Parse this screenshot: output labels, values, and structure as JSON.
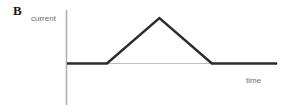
{
  "figure": {
    "panel_label": "B",
    "background_color": "#ffffff"
  },
  "axes": {
    "y_label": "current",
    "x_label": "time",
    "label_color": "#6e6e6e",
    "axis_color": "#b0b0b0",
    "y_axis": {
      "x": 66.5,
      "y_top": 10,
      "y_bottom": 105
    },
    "x_axis": {
      "y": 63.5,
      "x_left": 66.5,
      "x_right": 278
    }
  },
  "trace": {
    "color": "#2b2b2b",
    "width": 2.4,
    "points": "67,63.5 107,63.5 160,18 213,63.5 277,63.5"
  },
  "chart_data": {
    "type": "line",
    "title": "",
    "subtitle": "",
    "xlabel": "time",
    "ylabel": "current",
    "grid": false,
    "legend": null,
    "annotations": [
      "B"
    ],
    "axis_ticks": {
      "x": [],
      "y": []
    },
    "xlim": [
      0,
      1
    ],
    "ylim": [
      0,
      1
    ],
    "series": [
      {
        "name": "current",
        "x": [
          0.0,
          0.19,
          0.44,
          0.69,
          1.0
        ],
        "y": [
          0.0,
          0.0,
          1.0,
          0.0,
          0.0
        ]
      }
    ]
  }
}
